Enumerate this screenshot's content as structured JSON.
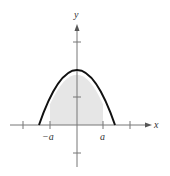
{
  "diagram": {
    "type": "parabola-area",
    "axes": {
      "x_label": "x",
      "y_label": "y"
    },
    "tick_labels": {
      "neg_a": "−a",
      "pos_a": "a"
    },
    "colors": {
      "curve": "#111111",
      "fill": "#e6e6e6",
      "axis": "#777777"
    }
  }
}
